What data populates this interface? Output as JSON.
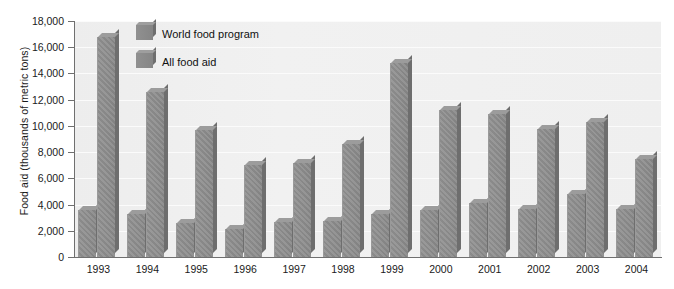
{
  "chart_data": {
    "type": "bar",
    "title": "",
    "xlabel": "",
    "ylabel": "Food aid (thousands of metric tons)",
    "ylim": [
      0,
      18000
    ],
    "ytick_labels": [
      "18,000",
      "16,000",
      "14,000",
      "12,000",
      "10,000",
      "8,000",
      "6,000",
      "4,000",
      "2,000",
      "0"
    ],
    "ytick_values": [
      18000,
      16000,
      14000,
      12000,
      10000,
      8000,
      6000,
      4000,
      2000,
      0
    ],
    "grid": true,
    "legend_position": "top-left-inside",
    "categories": [
      "1993",
      "1994",
      "1995",
      "1996",
      "1997",
      "1998",
      "1999",
      "2000",
      "2001",
      "2002",
      "2003",
      "2004"
    ],
    "series": [
      {
        "name": "World food program",
        "color": "#8c8c8c",
        "values": [
          3600,
          3300,
          2600,
          2150,
          2700,
          2750,
          3300,
          3600,
          4150,
          3700,
          4800,
          3650
        ]
      },
      {
        "name": "All food aid",
        "color": "#8c8c8c",
        "values": [
          16800,
          12600,
          9700,
          7000,
          7150,
          8650,
          14800,
          11200,
          10900,
          9750,
          10300,
          7500
        ]
      }
    ]
  },
  "legend": {
    "items": [
      {
        "label": "World food program"
      },
      {
        "label": "All food aid"
      }
    ]
  },
  "colors": {
    "bar": "#8c8c8c",
    "plot_background": "#efefef",
    "gridline": "#fbfbfb",
    "axis": "#6f6f6f",
    "text": "#1a1a1a"
  }
}
